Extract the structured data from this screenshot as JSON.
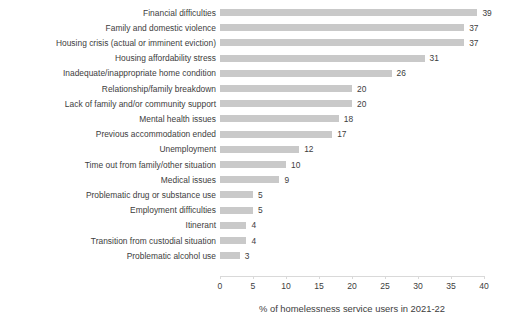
{
  "chart_data": {
    "type": "bar",
    "orientation": "horizontal",
    "title": "",
    "xlabel": "% of homelessness service users in 2021-22",
    "ylabel": "",
    "xlim": [
      0,
      40
    ],
    "xticks": [
      0,
      5,
      10,
      15,
      20,
      25,
      30,
      35,
      40
    ],
    "xtick_labels": [
      "0",
      "5",
      "10",
      "15",
      "20",
      "25",
      "30",
      "35",
      "40"
    ],
    "grid": false,
    "legend": null,
    "bar_color": "#c9c9c9",
    "text_color": "#3d3d3d",
    "background_color": "#ffffff",
    "categories": [
      "Financial difficulties",
      "Family and domestic violence",
      "Housing crisis (actual or imminent eviction)",
      "Housing affordability stress",
      "Inadequate/inappropriate home condition",
      "Relationship/family breakdown",
      "Lack of family and/or community support",
      "Mental health issues",
      "Previous accommodation ended",
      "Unemployment",
      "Time out from family/other situation",
      "Medical issues",
      "Problematic drug or substance use",
      "Employment difficulties",
      "Itinerant",
      "Transition from custodial situation",
      "Problematic alcohol use"
    ],
    "values": [
      39,
      37,
      37,
      31,
      26,
      20,
      20,
      18,
      17,
      12,
      10,
      9,
      5,
      5,
      4,
      4,
      3
    ],
    "value_labels": [
      "39",
      "37",
      "37",
      "31",
      "26",
      "20",
      "20",
      "18",
      "17",
      "12",
      "10",
      "9",
      "5",
      "5",
      "4",
      "4",
      "3"
    ]
  }
}
